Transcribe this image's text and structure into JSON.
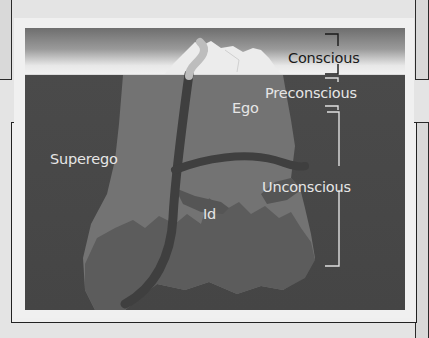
{
  "diagram": {
    "labels": {
      "conscious": "Conscious",
      "preconscious": "Preconscious",
      "unconscious": "Unconscious",
      "ego": "Ego",
      "superego": "Superego",
      "id": "Id"
    },
    "colors": {
      "page_background": "#e4e4e4",
      "sky_top": "#6e6e6e",
      "sky_bottom": "#f2f2f2",
      "water": "#474747",
      "iceberg_upper": "#7a7a7a",
      "iceberg_lower": "#5e5e5e",
      "divider_band": "#3e3e3e",
      "ice_tip": "#ececec",
      "bracket_light": "#e0e0e0",
      "bracket_dark": "#1a1a1a"
    }
  }
}
